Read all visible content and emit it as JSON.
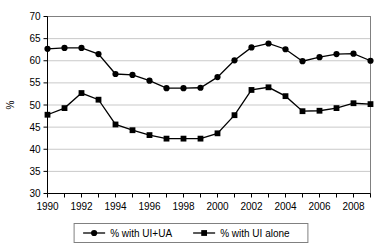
{
  "chart_data": {
    "type": "line",
    "title": "",
    "subtitle": "",
    "xlabel": "",
    "ylabel": "%",
    "x": [
      1990,
      1991,
      1992,
      1993,
      1994,
      1995,
      1996,
      1997,
      1998,
      1999,
      2000,
      2001,
      2002,
      2003,
      2004,
      2005,
      2006,
      2007,
      2008,
      2009
    ],
    "xlim": [
      1990,
      2009
    ],
    "ylim": [
      30,
      70
    ],
    "y_ticks": [
      30,
      35,
      40,
      45,
      50,
      55,
      60,
      65,
      70
    ],
    "x_tick_labels": [
      "1990",
      "1992",
      "1994",
      "1996",
      "1998",
      "2000",
      "2002",
      "2004",
      "2006",
      "2008"
    ],
    "x_tick_label_values": [
      1990,
      1992,
      1994,
      1996,
      1998,
      2000,
      2002,
      2004,
      2006,
      2008
    ],
    "grid": "horizontal",
    "legend_position": "bottom",
    "series": [
      {
        "name": "% with UI+UA",
        "marker": "circle",
        "color": "#000000",
        "values": [
          62.7,
          62.9,
          62.9,
          61.5,
          57.0,
          56.8,
          55.5,
          53.8,
          53.8,
          53.9,
          56.3,
          60.1,
          63.0,
          63.9,
          62.6,
          59.9,
          60.8,
          61.5,
          61.6,
          60.0
        ]
      },
      {
        "name": "% with UI alone",
        "marker": "square",
        "color": "#000000",
        "values": [
          47.8,
          49.3,
          52.7,
          51.2,
          45.6,
          44.3,
          43.2,
          42.4,
          42.4,
          42.4,
          43.6,
          47.7,
          53.4,
          54.0,
          52.0,
          48.6,
          48.7,
          49.3,
          50.4,
          50.2
        ]
      }
    ]
  },
  "legend": {
    "items": [
      {
        "label": "% with UI+UA",
        "marker": "circle"
      },
      {
        "label": "% with UI alone",
        "marker": "square"
      }
    ]
  }
}
